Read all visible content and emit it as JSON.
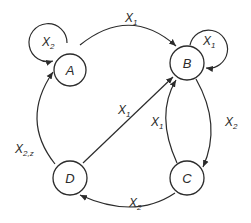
{
  "diagram": {
    "type": "state-transition-graph",
    "nodes": [
      {
        "id": "A",
        "label": "A"
      },
      {
        "id": "B",
        "label": "B"
      },
      {
        "id": "C",
        "label": "C"
      },
      {
        "id": "D",
        "label": "D"
      }
    ],
    "edges": [
      {
        "from": "A",
        "to": "A",
        "label": "X",
        "sub": "2"
      },
      {
        "from": "A",
        "to": "B",
        "label": "X",
        "sub": "1"
      },
      {
        "from": "B",
        "to": "B",
        "label": "X",
        "sub": "1"
      },
      {
        "from": "D",
        "to": "A",
        "label": "X",
        "sub": "2,z"
      },
      {
        "from": "D",
        "to": "B",
        "label": "X",
        "sub": "1"
      },
      {
        "from": "C",
        "to": "B",
        "label": "X",
        "sub": "1"
      },
      {
        "from": "B",
        "to": "C",
        "label": "X",
        "sub": "2"
      },
      {
        "from": "C",
        "to": "D",
        "label": "X",
        "sub": "2"
      }
    ]
  },
  "colors": {
    "stroke": "#2b2b2b",
    "background": "#ffffff"
  }
}
